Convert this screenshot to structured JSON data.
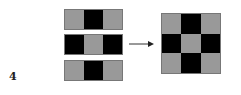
{
  "figure_label": "4",
  "colors": {
    "gray": "#999999",
    "black": "#000000",
    "border": "#777777"
  },
  "strips": [
    {
      "cells": [
        "gray",
        "black",
        "gray"
      ],
      "top": 9
    },
    {
      "cells": [
        "black",
        "gray",
        "black"
      ],
      "top": 34
    },
    {
      "cells": [
        "gray",
        "black",
        "gray"
      ],
      "top": 60
    }
  ],
  "result_grid": {
    "rows": [
      [
        "gray",
        "black",
        "gray"
      ],
      [
        "black",
        "gray",
        "black"
      ],
      [
        "gray",
        "black",
        "gray"
      ]
    ]
  },
  "arrow": {
    "direction": "right"
  }
}
